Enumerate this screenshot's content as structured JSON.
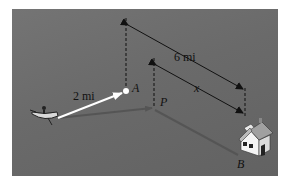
{
  "diagram": {
    "labels": {
      "six_mi": "6 mi",
      "x": "x",
      "two_mi": "2 mi",
      "A": "A",
      "P": "P",
      "B": "B"
    },
    "colors": {
      "water": "#6b6b6b",
      "white_arrow": "#ffffff",
      "path_line": "#555555",
      "dimension": "#111111",
      "house_roof": "#a0a0a0",
      "house_wall": "#f2f2f2"
    },
    "elements": {
      "boat": "rowboat-icon",
      "house": "house-icon",
      "point_A": "point-marker"
    }
  }
}
